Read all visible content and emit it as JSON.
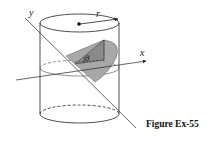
{
  "figure": {
    "caption": "Figure Ex-55",
    "labels": {
      "x_axis": "x",
      "y_axis": "y",
      "radius": "r",
      "angle": "θ"
    },
    "colors": {
      "stroke": "#222222",
      "wedge_fill": "#9a9a9a",
      "wedge_light": "#c4c4c4",
      "background": "#ffffff"
    },
    "elements": [
      "cylinder",
      "top-ellipse",
      "bottom-ellipse",
      "middle-cross-section-ellipse",
      "center-point",
      "radius-arrow",
      "x-axis",
      "y-axis",
      "shaded-wedge",
      "angle-theta"
    ]
  }
}
